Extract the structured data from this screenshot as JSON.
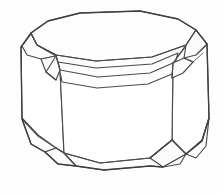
{
  "figure": {
    "title": "Octagonal Emerald-Cut Crystal",
    "description": "Line drawing of a faceted gemstone crystal shown in three-quarter perspective",
    "caption": "",
    "background_color": "#fdfdfd",
    "line_color": "#4a4a4a",
    "outline_color": "#3f3f3f",
    "fill_color": "#ffffff",
    "width": 223,
    "height": 195,
    "line_weight_main": 1.35,
    "line_weight_facet": 1.15,
    "line_weight_thin": 0.9
  },
  "geometry": {
    "top_table": {
      "name": "top-table-facet",
      "points": "31,33 48,21 80,13 140,11 178,19 196,30 186,45 152,57 96,61 56,55 37,45"
    },
    "girdle_band": {
      "name": "girdle-band-facet",
      "points": "58,62 96,68 152,64 178,53 172,74 148,84 97,88 62,82"
    },
    "front_body": {
      "name": "front-body-facet",
      "points": "60,70 98,77 150,73 173,63 172,140 150,158 100,163 64,153"
    },
    "left_body": {
      "name": "left-body-facet",
      "points": "21,47 37,46 56,57 60,70 64,153 56,148 38,135 22,118"
    },
    "right_body": {
      "name": "right-body-facet",
      "points": "186,46 196,31 207,44 209,118 202,140 186,154 172,140 173,63"
    },
    "bevels": [
      {
        "name": "bevel-top-left",
        "points": "22,46 31,34 37,45 56,56 41,59 27,55"
      },
      {
        "name": "bevel-top-left-inner",
        "points": "41,59 56,56 60,70 56,80 46,72"
      },
      {
        "name": "bevel-top-right",
        "points": "186,45 196,30 207,44 196,55 184,58"
      },
      {
        "name": "bevel-top-right-inner",
        "points": "184,58 173,63 172,78 183,73 193,62"
      },
      {
        "name": "bevel-bottom-left",
        "points": "22,119 38,136 56,148 45,152 31,144"
      },
      {
        "name": "bevel-bottom-left-inner",
        "points": "45,152 56,148 64,153 76,166 58,164"
      },
      {
        "name": "bevel-bottom-right",
        "points": "209,118 202,141 186,154 196,158 206,146"
      },
      {
        "name": "bevel-bottom-right-inner",
        "points": "186,154 172,140 150,158 163,167 180,164"
      }
    ],
    "facet_edges": [
      {
        "name": "edge-top-left-crease",
        "path": "M31,33 L37,45 L56,55 L60,70"
      },
      {
        "name": "edge-top-right-crease",
        "path": "M196,30 L186,45 L173,63 L172,78"
      },
      {
        "name": "edge-girdle-left",
        "path": "M56,56 L46,72 L56,80"
      },
      {
        "name": "edge-girdle-right",
        "path": "M184,58 L193,62"
      },
      {
        "name": "edge-bottom-left-crease",
        "path": "M56,148 L64,153 L76,166"
      },
      {
        "name": "edge-bottom-right-crease",
        "path": "M186,154 L172,140 L150,158"
      },
      {
        "name": "edge-table-front",
        "path": "M37,45 L56,55 L96,61 L152,57 L186,45"
      },
      {
        "name": "edge-girdle-front",
        "path": "M60,70 L98,77 L150,73 L173,63"
      },
      {
        "name": "edge-base-front",
        "path": "M64,153 L100,163 L150,158 L172,140"
      },
      {
        "name": "edge-base-seam",
        "path": "M76,166 L104,170 L150,166 L163,167"
      },
      {
        "name": "edge-right-double",
        "path": "M196,55 L206,46"
      },
      {
        "name": "edge-right-double-2",
        "path": "M193,62 L203,53"
      }
    ],
    "outline_silhouette": {
      "name": "crystal-outline",
      "points": "31,33 48,21 80,13 140,11 178,19 196,30 207,44 209,118 202,141 186,154 163,167 150,166 104,170 76,166 58,164 45,152 31,144 22,119 21,47"
    }
  },
  "labels": {
    "figure_label": "",
    "axis_note": ""
  }
}
